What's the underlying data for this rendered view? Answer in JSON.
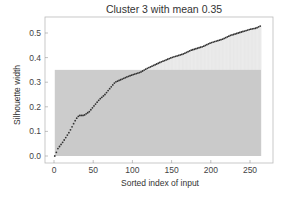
{
  "chart_data": {
    "type": "scatter",
    "title": "Cluster 3 with mean 0.35",
    "xlabel": "Sorted index of input",
    "ylabel": "Silhouette width",
    "xlim": [
      -6,
      275
    ],
    "ylim": [
      -0.02,
      0.56
    ],
    "xticks": [
      0,
      50,
      100,
      150,
      200,
      250
    ],
    "yticks": [
      0.0,
      0.1,
      0.2,
      0.3,
      0.4,
      0.5
    ],
    "ytick_labels": [
      "0.0",
      "0.1",
      "0.2",
      "0.3",
      "0.4",
      "0.5"
    ],
    "grid": false,
    "mean": 0.35,
    "n_points": 264,
    "series": [
      {
        "name": "silhouette",
        "marker": "dot",
        "color": "#333333",
        "x": [
          1,
          5,
          12,
          20,
          28,
          32,
          38,
          45,
          50,
          58,
          65,
          70,
          78,
          85,
          92,
          100,
          110,
          118,
          125,
          135,
          150,
          165,
          175,
          190,
          200,
          215,
          225,
          240,
          250,
          258,
          264
        ],
        "y": [
          0.0,
          0.03,
          0.06,
          0.1,
          0.15,
          0.165,
          0.165,
          0.18,
          0.2,
          0.23,
          0.25,
          0.27,
          0.3,
          0.31,
          0.32,
          0.33,
          0.34,
          0.355,
          0.365,
          0.38,
          0.4,
          0.415,
          0.43,
          0.445,
          0.46,
          0.475,
          0.49,
          0.505,
          0.515,
          0.52,
          0.53
        ]
      }
    ],
    "annotations": [
      {
        "type": "mean-rect",
        "y": 0.35,
        "x_range": [
          1,
          264
        ],
        "color": "#c8c8c8"
      }
    ],
    "colors": {
      "mean_rect": "#c6c6c6",
      "bars": "#e4e4e4",
      "frame": "#bbbbbb",
      "points": "#333333"
    }
  }
}
